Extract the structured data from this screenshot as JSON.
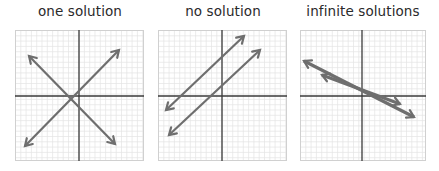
{
  "figure": {
    "panels": [
      {
        "id": "one",
        "title": "one solution",
        "x": 15,
        "w": 129,
        "axis_x": 64,
        "axis_y": 66,
        "lines": [
          {
            "name": "line-a",
            "x1": 10,
            "y1": 116,
            "x2": 104,
            "y2": 20,
            "width": 2.2
          },
          {
            "name": "line-b",
            "x1": 14,
            "y1": 26,
            "x2": 100,
            "y2": 114,
            "width": 2.2
          }
        ]
      },
      {
        "id": "none",
        "title": "no solution",
        "x": 158,
        "w": 129,
        "axis_x": 64,
        "axis_y": 66,
        "lines": [
          {
            "name": "line-a",
            "x1": 8,
            "y1": 80,
            "x2": 86,
            "y2": 6,
            "width": 2.2
          },
          {
            "name": "line-b",
            "x1": 11,
            "y1": 105,
            "x2": 102,
            "y2": 20,
            "width": 2.2
          }
        ]
      },
      {
        "id": "infinite",
        "title": "infinite solutions",
        "x": 300,
        "w": 126,
        "axis_x": 62,
        "axis_y": 66,
        "lines": [
          {
            "name": "line-a",
            "x1": 4,
            "y1": 31,
            "x2": 114,
            "y2": 87,
            "width": 3.2
          },
          {
            "name": "line-b",
            "x1": 22,
            "y1": 45,
            "x2": 100,
            "y2": 74,
            "width": 3.2
          }
        ]
      }
    ],
    "colors": {
      "grid": "#e4e4e4",
      "border": "#d0d0d0",
      "axis": "#3a3a3a",
      "line": "#6e6e6e",
      "title": "#2a2a2a"
    }
  }
}
